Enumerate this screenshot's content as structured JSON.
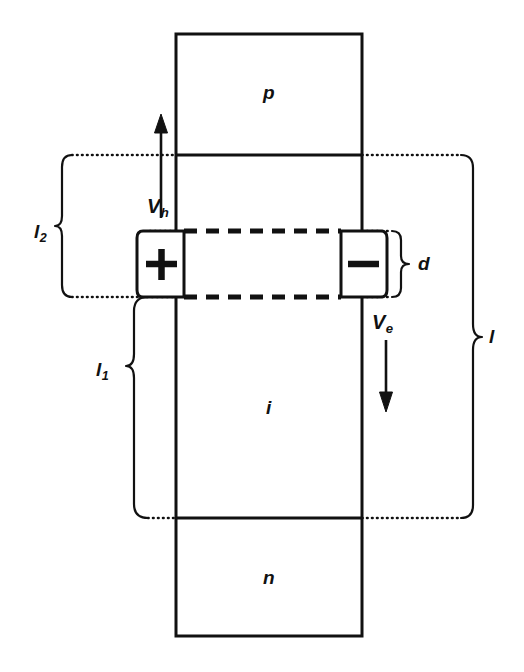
{
  "figure": {
    "type": "semiconductor-device-cross-section",
    "background_color": "#ffffff",
    "line_color": "#111111"
  },
  "regions": [
    {
      "id": "p",
      "label": "p",
      "x": 268,
      "y": 93
    },
    {
      "id": "i",
      "label": "i",
      "x": 268,
      "y": 408
    },
    {
      "id": "n",
      "label": "n",
      "x": 268,
      "y": 578
    }
  ],
  "charges": [
    {
      "id": "positive",
      "symbol": "+",
      "x": 161,
      "y": 264
    },
    {
      "id": "negative",
      "symbol": "−",
      "x": 363,
      "y": 264
    }
  ],
  "velocities": [
    {
      "id": "v-h",
      "base": "V",
      "subscript": "h",
      "label": "V_h",
      "direction": "up",
      "x": 161,
      "y": 206
    },
    {
      "id": "v-e",
      "base": "V",
      "subscript": "e",
      "label": "V_e",
      "direction": "down",
      "x": 386,
      "y": 322
    }
  ],
  "dimensions": [
    {
      "id": "l2",
      "base": "l",
      "subscript": "2",
      "label": "l_2",
      "side": "left",
      "x": 42,
      "y": 232,
      "span_top": 155,
      "span_bottom": 297
    },
    {
      "id": "l1",
      "base": "l",
      "subscript": "1",
      "label": "l_1",
      "side": "left",
      "x": 103,
      "y": 370,
      "span_top": 297,
      "span_bottom": 518
    },
    {
      "id": "d",
      "base": "d",
      "subscript": "",
      "label": "d",
      "side": "right",
      "x": 424,
      "y": 264,
      "span_top": 231,
      "span_bottom": 297
    },
    {
      "id": "l",
      "base": "l",
      "subscript": "",
      "label": "l",
      "side": "right",
      "x": 491,
      "y": 337,
      "span_top": 155,
      "span_bottom": 518
    }
  ],
  "geometry": {
    "body_left": 176,
    "body_right": 362,
    "body_top": 34,
    "body_bottom": 636,
    "boundary_p_i": 155,
    "boundary_i_n": 518,
    "depletion_top": 231,
    "depletion_bottom": 297
  }
}
